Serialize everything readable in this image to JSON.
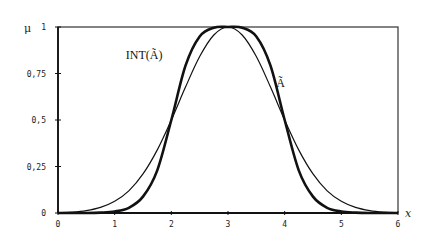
{
  "chart_data": {
    "type": "line",
    "title": "",
    "xlabel": "x",
    "ylabel": "μ",
    "xlim": [
      0,
      6
    ],
    "ylim": [
      0,
      1
    ],
    "grid": false,
    "legend": "inline labels",
    "x_ticks": [
      "0",
      "1",
      "2",
      "3",
      "4",
      "5",
      "6"
    ],
    "y_ticks": [
      "0",
      "0,25",
      "0,5",
      "0,75",
      "1"
    ],
    "x": [
      0,
      0.25,
      0.5,
      0.75,
      1,
      1.25,
      1.5,
      1.75,
      2,
      2.25,
      2.5,
      2.75,
      3,
      3.25,
      3.5,
      3.75,
      4,
      4.25,
      4.5,
      4.75,
      5,
      5.25,
      5.5,
      5.75,
      6
    ],
    "series": [
      {
        "name": "Ã",
        "style": "thin",
        "values": [
          0.002,
          0.005,
          0.013,
          0.03,
          0.063,
          0.119,
          0.21,
          0.338,
          0.5,
          0.677,
          0.841,
          0.957,
          1.0,
          0.957,
          0.841,
          0.677,
          0.5,
          0.338,
          0.21,
          0.119,
          0.063,
          0.03,
          0.013,
          0.005,
          0.002
        ]
      },
      {
        "name": "INT(Ã)",
        "style": "thick",
        "values": [
          0.0,
          0.0,
          0.0,
          0.002,
          0.008,
          0.028,
          0.088,
          0.228,
          0.5,
          0.792,
          0.949,
          0.996,
          1.0,
          0.996,
          0.949,
          0.792,
          0.5,
          0.228,
          0.088,
          0.028,
          0.008,
          0.002,
          0.0,
          0.0,
          0.0
        ]
      }
    ],
    "annotations": [
      {
        "text": "INT(Ã)",
        "x": 1.55,
        "y": 0.83
      },
      {
        "text": "Ã",
        "x": 3.85,
        "y": 0.68
      }
    ]
  },
  "labels": {
    "y_axis": "μ",
    "x_axis": "x",
    "series_a": "Ã",
    "series_int": "INT(Ã)"
  }
}
